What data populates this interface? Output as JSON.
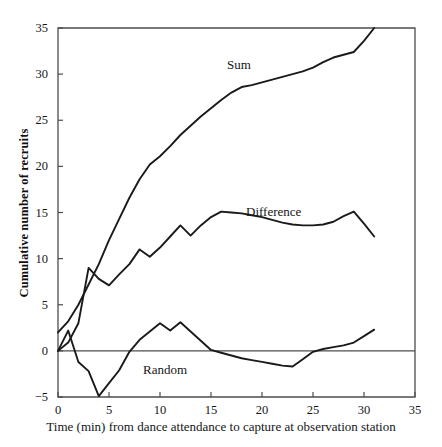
{
  "chart_data": {
    "type": "line",
    "title": "",
    "xlabel": "Time (min) from dance attendance to capture at observation station",
    "ylabel": "Cumulative number of recruits",
    "xlim": [
      0,
      35
    ],
    "ylim": [
      -5,
      35
    ],
    "xticks": [
      0,
      5,
      10,
      15,
      20,
      25,
      30,
      35
    ],
    "xtick_labels": [
      "0",
      "5",
      "10",
      "15",
      "20",
      "25",
      "30",
      "35"
    ],
    "yticks": [
      -5,
      0,
      5,
      10,
      15,
      20,
      25,
      30,
      35
    ],
    "ytick_labels": [
      "-5",
      "0",
      "5",
      "10",
      "15",
      "20",
      "25",
      "30",
      "35"
    ],
    "grid": false,
    "legend_position": "inline-annotations",
    "zero_line": true,
    "line_color": "#1a1a1a",
    "axis_color": "#4d4d4d",
    "background": "#ffffff",
    "series": [
      {
        "name": "Sum",
        "label_x": 16.5,
        "label_y": 30.2,
        "x": [
          0,
          1,
          2,
          3,
          4,
          5,
          6,
          7,
          8,
          9,
          10,
          11,
          12,
          13,
          14,
          15,
          16,
          17,
          18,
          19,
          20,
          21,
          22,
          23,
          24,
          25,
          26,
          27,
          28,
          29,
          30,
          31
        ],
        "y": [
          2.0,
          3.2,
          5.0,
          7.2,
          9.4,
          12.0,
          14.3,
          16.6,
          18.6,
          20.2,
          21.1,
          22.2,
          23.4,
          24.4,
          25.4,
          26.3,
          27.2,
          28.0,
          28.6,
          28.8,
          29.1,
          29.4,
          29.7,
          30.0,
          30.3,
          30.7,
          31.3,
          31.8,
          32.1,
          32.4,
          33.6,
          35.0
        ]
      },
      {
        "name": "Difference",
        "label_x": 20.8,
        "label_y": 13.0,
        "x": [
          0,
          1,
          2,
          3,
          4,
          5,
          6,
          7,
          8,
          9,
          10,
          11,
          12,
          13,
          14,
          15,
          16,
          17,
          18,
          19,
          20,
          21,
          22,
          23,
          24,
          25,
          26,
          27,
          28,
          29,
          30,
          31
        ],
        "y": [
          0.0,
          0.9,
          3.0,
          9.0,
          7.8,
          7.1,
          8.3,
          9.4,
          11.0,
          10.2,
          11.2,
          12.4,
          13.6,
          12.5,
          13.6,
          14.5,
          15.1,
          15.0,
          14.9,
          14.7,
          14.5,
          14.2,
          13.9,
          13.7,
          13.6,
          13.6,
          13.7,
          14.0,
          14.6,
          15.1,
          13.8,
          12.4
        ]
      },
      {
        "name": "Random",
        "label_x": 9.2,
        "label_y": -1.4,
        "x": [
          0,
          1,
          2,
          3,
          4,
          5,
          6,
          7,
          8,
          9,
          10,
          11,
          12,
          13,
          14,
          15,
          16,
          17,
          18,
          19,
          20,
          21,
          22,
          23,
          24,
          25,
          26,
          27,
          28,
          29,
          30,
          31
        ],
        "y": [
          0.0,
          2.2,
          -1.2,
          -2.2,
          -4.9,
          -3.5,
          -2.1,
          -0.1,
          1.2,
          2.1,
          3.0,
          2.2,
          3.1,
          2.1,
          1.1,
          0.1,
          -0.2,
          -0.5,
          -0.8,
          -1.0,
          -1.2,
          -1.4,
          -1.6,
          -1.7,
          -0.9,
          -0.1,
          0.2,
          0.4,
          0.6,
          0.9,
          1.6,
          2.3
        ]
      }
    ]
  }
}
